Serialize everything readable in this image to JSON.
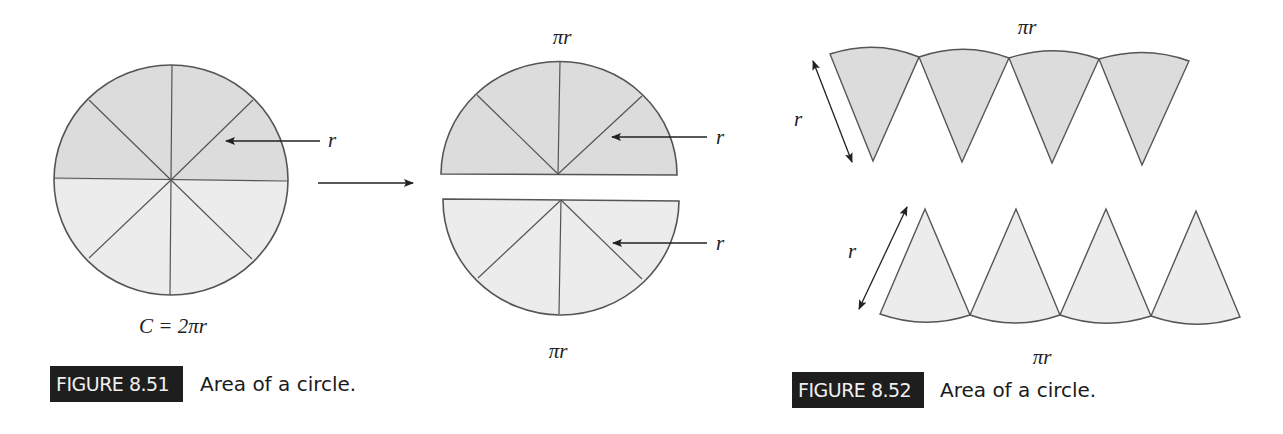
{
  "figures": [
    {
      "id": "8.51",
      "label": "FIGURE 8.51",
      "caption": "Area of a circle.",
      "circle": {
        "label_circumference": "C = 2πr",
        "radius_label": "r",
        "sectors": 8
      },
      "rearranged": {
        "top_arc_label": "πr",
        "bottom_arc_label": "πr",
        "upper_radius_label": "r",
        "lower_radius_label": "r"
      }
    },
    {
      "id": "8.52",
      "label": "FIGURE 8.52",
      "caption": "Area of a circle.",
      "upper_row": {
        "arc_label": "πr",
        "radius_label": "r",
        "sectors": 4
      },
      "lower_row": {
        "arc_label": "πr",
        "radius_label": "r",
        "sectors": 4
      }
    }
  ],
  "colors": {
    "upper_fill": "#dcdcdc",
    "lower_fill": "#ececec",
    "stroke": "#555555",
    "label_bg": "#1e1e1e",
    "label_text": "#f0f0f0"
  }
}
